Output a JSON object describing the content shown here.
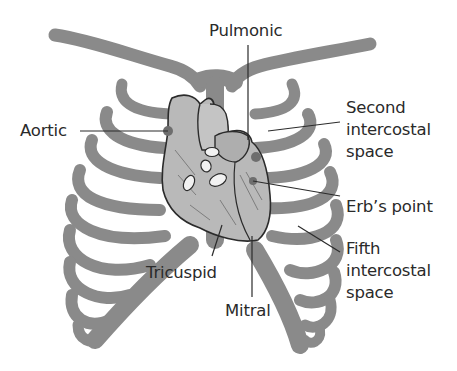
{
  "diagram": {
    "type": "anatomical-illustration",
    "colors": {
      "bone": "#8a8a8a",
      "heart_fill": "#b9b9b9",
      "heart_outline": "#2b2b2b",
      "valve_fill": "#f2f2f2",
      "leader_line": "#2b2b2b",
      "text": "#2a2a2a",
      "background": "#ffffff"
    },
    "labels": {
      "pulmonic": "Pulmonic",
      "aortic": "Aortic",
      "second_intercostal": [
        "Second",
        "intercostal",
        "space"
      ],
      "erbs_point": "Erb’s point",
      "fifth_intercostal": [
        "Fifth",
        "intercostal",
        "space"
      ],
      "tricuspid": "Tricuspid",
      "mitral": "Mitral"
    }
  }
}
